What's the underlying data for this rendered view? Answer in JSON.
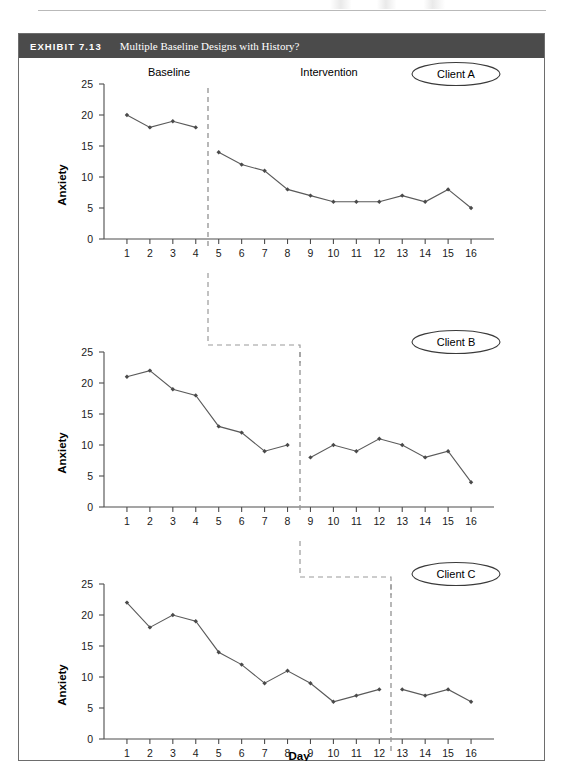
{
  "exhibit": {
    "number": "EXHIBIT 7.13",
    "title": "Multiple Baseline Designs with History?"
  },
  "labels": {
    "baseline": "Baseline",
    "intervention": "Intervention",
    "y_axis": "Anxiety",
    "x_axis": "Day",
    "client_a": "Client A",
    "client_b": "Client B",
    "client_c": "Client C"
  },
  "axis": {
    "y_ticks": [
      "0",
      "5",
      "10",
      "15",
      "20",
      "25"
    ],
    "x_ticks": [
      "1",
      "2",
      "3",
      "4",
      "5",
      "6",
      "7",
      "8",
      "9",
      "10",
      "11",
      "12",
      "13",
      "14",
      "15",
      "16"
    ]
  },
  "colors": {
    "header_bg": "#4b4b4b",
    "series": "#5a5a5a",
    "marker": "#4a4a4a",
    "phase_line": "#9a9a9a",
    "frame": "#6d6d6d"
  },
  "chart_data": [
    {
      "type": "line",
      "title": "Client A",
      "xlabel": "Day",
      "ylabel": "Anxiety",
      "xlim": [
        0,
        17
      ],
      "ylim": [
        0,
        25
      ],
      "grid": false,
      "x": [
        1,
        2,
        3,
        4,
        5,
        6,
        7,
        8,
        9,
        10,
        11,
        12,
        13,
        14,
        15,
        16
      ],
      "values": [
        20,
        18,
        19,
        18,
        14,
        12,
        11,
        8,
        7,
        6,
        6,
        6,
        7,
        6,
        8,
        5
      ],
      "phase_change_after_day": 4,
      "phases": [
        {
          "label": "Baseline",
          "days": [
            1,
            4
          ]
        },
        {
          "label": "Intervention",
          "days": [
            5,
            16
          ]
        }
      ]
    },
    {
      "type": "line",
      "title": "Client B",
      "xlabel": "Day",
      "ylabel": "Anxiety",
      "xlim": [
        0,
        17
      ],
      "ylim": [
        0,
        25
      ],
      "grid": false,
      "x": [
        1,
        2,
        3,
        4,
        5,
        6,
        7,
        8,
        9,
        10,
        11,
        12,
        13,
        14,
        15,
        16
      ],
      "values": [
        21,
        22,
        19,
        18,
        13,
        12,
        9,
        10,
        8,
        10,
        9,
        11,
        10,
        8,
        9,
        4
      ],
      "phase_change_after_day": 8,
      "phases": [
        {
          "label": "Baseline",
          "days": [
            1,
            8
          ]
        },
        {
          "label": "Intervention",
          "days": [
            9,
            16
          ]
        }
      ]
    },
    {
      "type": "line",
      "title": "Client C",
      "xlabel": "Day",
      "ylabel": "Anxiety",
      "xlim": [
        0,
        17
      ],
      "ylim": [
        0,
        25
      ],
      "grid": false,
      "x": [
        1,
        2,
        3,
        4,
        5,
        6,
        7,
        8,
        9,
        10,
        11,
        12,
        13,
        14,
        15,
        16
      ],
      "values": [
        22,
        18,
        20,
        19,
        14,
        12,
        9,
        11,
        9,
        6,
        7,
        8,
        8,
        7,
        8,
        6
      ],
      "phase_change_after_day": 12,
      "phases": [
        {
          "label": "Baseline",
          "days": [
            1,
            12
          ]
        },
        {
          "label": "Intervention",
          "days": [
            13,
            16
          ]
        }
      ]
    }
  ]
}
